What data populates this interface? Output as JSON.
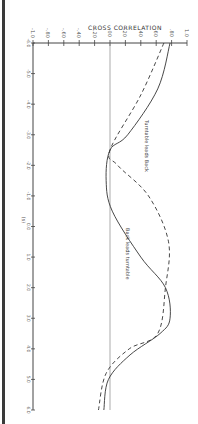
{
  "chart_data": {
    "type": "line",
    "orientation": "rotated-90 (correlation on horizontal axis, lag on vertical axis)",
    "title": "CROSS CORRELATION",
    "xlabel": "(s)",
    "ylabel": "CROSS CORRELATION",
    "ylim": [
      -1.0,
      1.0
    ],
    "xlim": [
      -6,
      6
    ],
    "correlation_ticks": [
      "-1.0",
      "-.80",
      "-.60",
      "-.40",
      "-.20",
      ".00",
      ".20",
      ".40",
      ".60",
      ".80",
      "1.0"
    ],
    "lag_ticks": [
      -6,
      -5,
      -4,
      -3,
      -2,
      -1,
      0,
      1,
      2,
      3,
      4,
      5,
      6
    ],
    "grid": false,
    "annotations": [
      "Turntable leads Back",
      "Back leads turntable"
    ],
    "series": [
      {
        "name": "solid",
        "style": "solid",
        "x": [
          -6,
          -4.5,
          -3,
          -2.5,
          -1.5,
          -0.5,
          1,
          2,
          3,
          3.5,
          4.2,
          5,
          6
        ],
        "values": [
          0.78,
          0.62,
          0.23,
          0.0,
          -0.05,
          0.03,
          0.4,
          0.72,
          0.78,
          0.65,
          0.26,
          -0.02,
          -0.08
        ]
      },
      {
        "name": "dashed",
        "style": "dashed",
        "x": [
          -6,
          -4.3,
          -2.5,
          -2.0,
          -1.0,
          0.5,
          2,
          3.5,
          4.0,
          4.8,
          6
        ],
        "values": [
          0.7,
          0.4,
          0.0,
          0.1,
          0.5,
          0.76,
          0.72,
          0.62,
          0.25,
          -0.05,
          -0.15
        ]
      }
    ]
  }
}
